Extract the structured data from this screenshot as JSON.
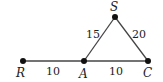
{
  "diagram": {
    "points": [
      {
        "id": "R",
        "label": "R",
        "x": 23,
        "y": 61
      },
      {
        "id": "A",
        "label": "A",
        "x": 84,
        "y": 61
      },
      {
        "id": "C",
        "label": "C",
        "x": 148,
        "y": 61
      },
      {
        "id": "S",
        "label": "S",
        "x": 115,
        "y": 17
      }
    ],
    "segments": [
      {
        "from": "R",
        "to": "A",
        "length": "10"
      },
      {
        "from": "A",
        "to": "C",
        "length": "10"
      },
      {
        "from": "A",
        "to": "S",
        "length": "15"
      },
      {
        "from": "S",
        "to": "C",
        "length": "20"
      }
    ],
    "labels": {
      "R": "R",
      "A": "A",
      "C": "C",
      "S": "S",
      "RA": "10",
      "AC": "10",
      "AS": "15",
      "SC": "20"
    }
  }
}
